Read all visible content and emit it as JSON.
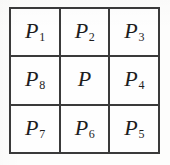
{
  "figure": {
    "name": "3x3-grid-of-labeled-cells",
    "rows": 3,
    "columns": 3,
    "border_color": "#3a3a3a",
    "text_color": "#1d1d1d",
    "background_color": "#fefefe",
    "cells": [
      {
        "id": "cell-r1c1",
        "base": "P",
        "sub": "1",
        "row": 1,
        "col": 1
      },
      {
        "id": "cell-r1c2",
        "base": "P",
        "sub": "2",
        "row": 1,
        "col": 2
      },
      {
        "id": "cell-r1c3",
        "base": "P",
        "sub": "3",
        "row": 1,
        "col": 3
      },
      {
        "id": "cell-r2c1",
        "base": "P",
        "sub": "8",
        "row": 2,
        "col": 1
      },
      {
        "id": "cell-r2c2",
        "base": "P",
        "sub": "",
        "row": 2,
        "col": 2
      },
      {
        "id": "cell-r2c3",
        "base": "P",
        "sub": "4",
        "row": 2,
        "col": 3
      },
      {
        "id": "cell-r3c1",
        "base": "P",
        "sub": "7",
        "row": 3,
        "col": 1
      },
      {
        "id": "cell-r3c2",
        "base": "P",
        "sub": "6",
        "row": 3,
        "col": 2
      },
      {
        "id": "cell-r3c3",
        "base": "P",
        "sub": "5",
        "row": 3,
        "col": 3
      }
    ]
  }
}
